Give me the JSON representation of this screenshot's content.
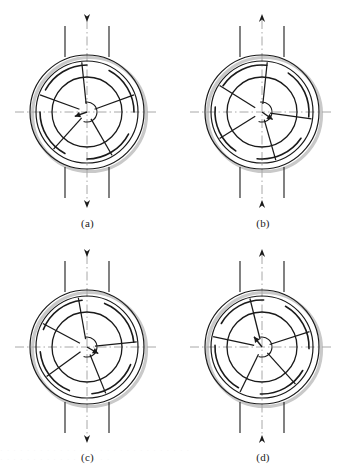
{
  "figure": {
    "panel_count": 4,
    "background_color": "#ffffff",
    "line_color": "#1a1a1a",
    "centerline_color": "#a8a8a8",
    "shadow_color": "#c9c9c9",
    "label_color": "#1c1c1c"
  },
  "geometry": {
    "center_x": 87,
    "center_y": 112,
    "housing_outer_radius": 57,
    "housing_inner_radius": 51,
    "pad_band_radius": 47,
    "journal_radius": 35,
    "hub_radius": 10,
    "spoke_count": 5,
    "pad_count": 4,
    "flow_line_offsets": [
      -22,
      22
    ],
    "flow_line_top_y": 26,
    "flow_line_bottom_y": 198,
    "centerline_half_length": 72
  },
  "panels": [
    {
      "id": "a",
      "label": "(a)",
      "top_arrow_direction": "down",
      "bottom_arrow_direction": "down",
      "flow_mode": "through-downward",
      "eccentricity_arrow_angle_deg": 200,
      "eccentricity_arrow_length": 13,
      "spoke_angles_deg": [
        96,
        160,
        228,
        300,
        20
      ],
      "pad_start_angles_deg": [
        28,
        118,
        208,
        298
      ],
      "pad_sweep_deg": 62
    },
    {
      "id": "b",
      "label": "(b)",
      "top_arrow_direction": "up",
      "bottom_arrow_direction": "up",
      "flow_mode": "through-upward",
      "eccentricity_arrow_angle_deg": 325,
      "eccentricity_arrow_length": 13,
      "spoke_angles_deg": [
        84,
        148,
        212,
        286,
        352
      ],
      "pad_start_angles_deg": [
        22,
        112,
        202,
        292
      ],
      "pad_sweep_deg": 62
    },
    {
      "id": "c",
      "label": "(c)",
      "top_arrow_direction": "down",
      "bottom_arrow_direction": "down",
      "flow_mode": "through-downward",
      "eccentricity_arrow_angle_deg": 330,
      "eccentricity_arrow_length": 13,
      "spoke_angles_deg": [
        100,
        152,
        216,
        292,
        6
      ],
      "pad_start_angles_deg": [
        34,
        124,
        214,
        304
      ],
      "pad_sweep_deg": 62
    },
    {
      "id": "d",
      "label": "(d)",
      "top_arrow_direction": "up",
      "bottom_arrow_direction": "up",
      "flow_mode": "through-upward",
      "eccentricity_arrow_angle_deg": 128,
      "eccentricity_arrow_length": 13,
      "spoke_angles_deg": [
        104,
        168,
        244,
        312,
        18
      ],
      "pad_start_angles_deg": [
        26,
        116,
        206,
        296
      ],
      "pad_sweep_deg": 62
    }
  ],
  "artifacts": {
    "bottom_ghost_text_line1": "· · ·  · · · · ·  · · · ·  · · · · · · ·  · ·  · · · · ·  · · ·",
    "bottom_ghost_text_line2": "· · · ·  · · ·   · · · ·   · · · · · ·"
  }
}
